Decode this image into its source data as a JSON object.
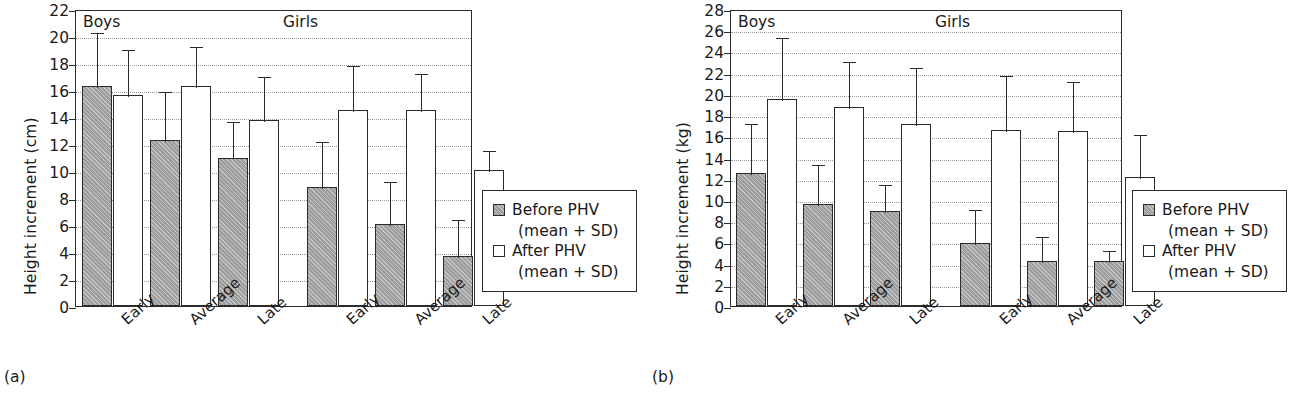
{
  "figure": {
    "caption_a": "(a)",
    "caption_b": "(b)"
  },
  "legend": {
    "before_label": "Before PHV",
    "before_sub": "(mean + SD)",
    "after_label": "After PHV",
    "after_sub": "(mean + SD)",
    "before_color": "#9d9d9d",
    "after_color": "#ffffff"
  },
  "chart_data": [
    {
      "type": "bar",
      "panel": "(a)",
      "title": "",
      "xlabel": "",
      "ylabel": "Height increment (cm)",
      "ylim": [
        0,
        22
      ],
      "ytick_step": 2,
      "yticks": [
        "0",
        "2",
        "4",
        "6",
        "8",
        "10",
        "12",
        "14",
        "16",
        "18",
        "20",
        "22"
      ],
      "grid": true,
      "legend_position": "right-outside",
      "group_labels": [
        "Boys",
        "Girls"
      ],
      "categories": [
        "Early",
        "Average",
        "Late",
        "Early",
        "Average",
        "Late"
      ],
      "series": [
        {
          "name": "Before PHV (mean + SD)",
          "values": [
            16.3,
            12.3,
            11.0,
            8.8,
            6.1,
            3.7
          ],
          "sd_top": [
            20.4,
            16.0,
            13.8,
            12.3,
            9.3,
            6.5
          ]
        },
        {
          "name": "After PHV (mean + SD)",
          "values": [
            15.6,
            16.3,
            13.8,
            14.5,
            14.5,
            10.1
          ],
          "sd_top": [
            19.1,
            19.3,
            17.1,
            17.9,
            17.3,
            11.6
          ]
        }
      ]
    },
    {
      "type": "bar",
      "panel": "(b)",
      "title": "",
      "xlabel": "",
      "ylabel": "Height increment (kg)",
      "ylim": [
        0,
        28
      ],
      "ytick_step": 2,
      "yticks": [
        "0",
        "2",
        "4",
        "6",
        "8",
        "10",
        "12",
        "14",
        "16",
        "18",
        "20",
        "22",
        "24",
        "26",
        "28"
      ],
      "grid": true,
      "legend_position": "right-outside",
      "group_labels": [
        "Boys",
        "Girls"
      ],
      "categories": [
        "Early",
        "Average",
        "Late",
        "Early",
        "Average",
        "Late"
      ],
      "series": [
        {
          "name": "Before PHV (mean + SD)",
          "values": [
            12.5,
            9.6,
            9.0,
            5.9,
            4.2,
            4.2
          ],
          "sd_top": [
            17.3,
            13.5,
            11.6,
            9.2,
            6.7,
            5.4
          ]
        },
        {
          "name": "After PHV (mean + SD)",
          "values": [
            19.5,
            18.8,
            17.2,
            16.6,
            16.5,
            12.2
          ],
          "sd_top": [
            25.5,
            23.2,
            22.6,
            21.9,
            21.3,
            16.3
          ]
        }
      ]
    }
  ]
}
